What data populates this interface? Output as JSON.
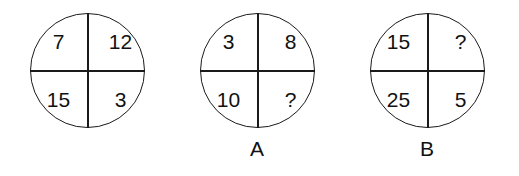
{
  "figure": {
    "name": "quadrant-circle-puzzle",
    "background_color": "#ffffff",
    "line_color": "#1a1a1a",
    "text_color": "#111111",
    "unknown_symbol": "?"
  },
  "circles": [
    {
      "label": "",
      "top_left": "7",
      "top_right": "12",
      "bottom_left": "15",
      "bottom_right": "3"
    },
    {
      "label": "A",
      "top_left": "3",
      "top_right": "8",
      "bottom_left": "10",
      "bottom_right": "?"
    },
    {
      "label": "B",
      "top_left": "15",
      "top_right": "?",
      "bottom_left": "25",
      "bottom_right": "5"
    }
  ]
}
